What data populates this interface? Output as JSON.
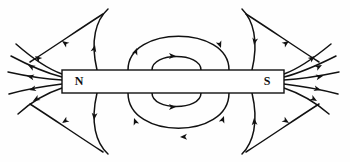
{
  "figure": {
    "background_color": "#fefefe",
    "line_color": "#111111",
    "width": 350,
    "height": 162
  },
  "magnet": {
    "label": "bar-magnet",
    "north_pole_label": "N",
    "south_pole_label": "S",
    "fill_color": "#ffffff",
    "stroke_color": "#111111",
    "x": 62,
    "y": 70,
    "width": 222,
    "height": 23
  },
  "chart_data": {
    "type": "diagram",
    "elements": {
      "magnet_poles": [
        "N",
        "S"
      ],
      "field_direction": "from N (left) to S (right) outside the magnet",
      "line_count_left_fan": 5,
      "line_count_right_fan": 5,
      "inner_loops_above": 2,
      "inner_loops_below": 2,
      "outer_arcs": 4
    },
    "arrows": {
      "left_fan_direction": "outward away from N pole",
      "right_fan_direction": "inward toward S pole",
      "loop_direction": "clockwise (left to right over the top, right to left under the bottom)"
    }
  },
  "field_lines": {
    "left_fan": [
      {
        "name": "left-fan-line-1",
        "d": "M 62 74 C 48 69 32 58 16 44"
      },
      {
        "name": "left-fan-line-2",
        "d": "M 62 77 C 46 73 28 65 11 56"
      },
      {
        "name": "left-fan-line-3",
        "d": "M 62 80 C 44 79 26 76 8 72"
      },
      {
        "name": "left-fan-line-4",
        "d": "M 62 84 C 45 86 27 89 9 94"
      },
      {
        "name": "left-fan-line-5",
        "d": "M 62 88 C 47 93 32 101 18 114"
      }
    ],
    "right_fan": [
      {
        "name": "right-fan-line-1",
        "d": "M 284 74 C 298 69 314 58 331 44"
      },
      {
        "name": "right-fan-line-2",
        "d": "M 284 77 C 300 73 318 65 336 56"
      },
      {
        "name": "right-fan-line-3",
        "d": "M 284 80 C 302 79 320 76 339 72"
      },
      {
        "name": "right-fan-line-4",
        "d": "M 284 84 C 301 86 319 89 338 94"
      },
      {
        "name": "right-fan-line-5",
        "d": "M 284 88 C 299 93 314 101 329 114"
      }
    ],
    "inner_loops_above": [
      {
        "name": "inner-loop-above-small",
        "d": "M 152 70 C 152 52 201 52 201 70"
      },
      {
        "name": "inner-loop-above-large",
        "d": "M 128 70 C 128 25 229 25 229 70"
      }
    ],
    "inner_loops_below": [
      {
        "name": "inner-loop-below-small",
        "d": "M 152 93 C 152 111 201 111 201 93"
      },
      {
        "name": "inner-loop-below-large",
        "d": "M 128 93 C 128 140 229 140 229 93"
      }
    ],
    "outer_arcs": [
      {
        "name": "outer-arc-top-left",
        "d": "M 97 70 C 90 40 96 20 108 9"
      },
      {
        "name": "outer-arc-top-right",
        "d": "M 252 70 C 259 40 253 20 242 9"
      },
      {
        "name": "outer-arc-bottom-left",
        "d": "M 97 93 C 90 123 96 143 108 154"
      },
      {
        "name": "outer-arc-bottom-right",
        "d": "M 252 93 C 259 123 253 143 242 154"
      },
      {
        "name": "outer-sweep-top-left",
        "d": "M 30 62 C 55 46 78 30 103 14"
      },
      {
        "name": "outer-sweep-top-right",
        "d": "M 319 62 C 294 46 271 30 246 14"
      },
      {
        "name": "outer-sweep-bottom-left",
        "d": "M 30 104 C 55 120 78 136 103 152"
      },
      {
        "name": "outer-sweep-bottom-right",
        "d": "M 319 104 C 294 120 271 136 246 152"
      }
    ]
  },
  "arrow_markers": [
    {
      "name": "arrow-left-fan-1",
      "x": 35,
      "y": 56,
      "angle": 218
    },
    {
      "name": "arrow-left-fan-2",
      "x": 28,
      "y": 65,
      "angle": 208
    },
    {
      "name": "arrow-left-fan-3",
      "x": 27,
      "y": 76,
      "angle": 192
    },
    {
      "name": "arrow-left-fan-4",
      "x": 29,
      "y": 90,
      "angle": 166
    },
    {
      "name": "arrow-left-fan-5",
      "x": 33,
      "y": 101,
      "angle": 150
    },
    {
      "name": "arrow-right-fan-1",
      "x": 315,
      "y": 56,
      "angle": 322
    },
    {
      "name": "arrow-right-fan-2",
      "x": 322,
      "y": 65,
      "angle": 332
    },
    {
      "name": "arrow-right-fan-3",
      "x": 323,
      "y": 76,
      "angle": 348
    },
    {
      "name": "arrow-right-fan-4",
      "x": 321,
      "y": 90,
      "angle": 14
    },
    {
      "name": "arrow-right-fan-5",
      "x": 317,
      "y": 101,
      "angle": 30
    },
    {
      "name": "arrow-inner-loop-above-small",
      "x": 176,
      "y": 56,
      "angle": 0
    },
    {
      "name": "arrow-inner-loop-above-large-left",
      "x": 137,
      "y": 48,
      "angle": 290
    },
    {
      "name": "arrow-inner-loop-above-large-right",
      "x": 221,
      "y": 48,
      "angle": 70
    },
    {
      "name": "arrow-inner-loop-below-small",
      "x": 176,
      "y": 107,
      "angle": 0
    },
    {
      "name": "arrow-inner-loop-below-large-left",
      "x": 134,
      "y": 118,
      "angle": 250
    },
    {
      "name": "arrow-inner-loop-below-large-right",
      "x": 224,
      "y": 116,
      "angle": 290
    },
    {
      "name": "arrow-inner-loop-below-large-bottom",
      "x": 180,
      "y": 137,
      "angle": 178
    },
    {
      "name": "arrow-outer-arc-top-left",
      "x": 95,
      "y": 45,
      "angle": 283
    },
    {
      "name": "arrow-outer-arc-top-right",
      "x": 254,
      "y": 45,
      "angle": 100
    },
    {
      "name": "arrow-outer-arc-bottom-left",
      "x": 94,
      "y": 120,
      "angle": 95
    },
    {
      "name": "arrow-outer-arc-bottom-right",
      "x": 254,
      "y": 118,
      "angle": 265
    },
    {
      "name": "arrow-outer-sweep-top-left",
      "x": 62,
      "y": 41,
      "angle": 215
    },
    {
      "name": "arrow-outer-sweep-top-right",
      "x": 289,
      "y": 41,
      "angle": 325
    },
    {
      "name": "arrow-outer-sweep-bottom-left",
      "x": 62,
      "y": 123,
      "angle": 147
    },
    {
      "name": "arrow-outer-sweep-bottom-right",
      "x": 289,
      "y": 123,
      "angle": 33
    }
  ]
}
